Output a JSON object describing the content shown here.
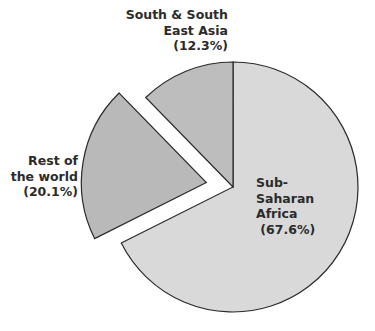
{
  "chart_data": {
    "type": "pie",
    "title": "",
    "start": "top",
    "direction": "clockwise",
    "slices": [
      {
        "name": "Sub-Saharan Africa",
        "value": 67.6,
        "label_lines": [
          "Sub-",
          "Saharan",
          "Africa",
          " (67.6%)"
        ],
        "label_align": "start",
        "color": "#d9d9d9",
        "exploded": false
      },
      {
        "name": "Rest of the world",
        "value": 20.1,
        "label_lines": [
          "Rest of",
          "the world",
          "(20.1%)"
        ],
        "label_align": "end",
        "color": "#b9b9b9",
        "exploded": true
      },
      {
        "name": "South & South East Asia",
        "value": 12.3,
        "label_lines": [
          "South & South",
          "East Asia",
          "(12.3%)"
        ],
        "label_align": "end",
        "color": "#bdbdbd",
        "exploded": false
      }
    ]
  }
}
